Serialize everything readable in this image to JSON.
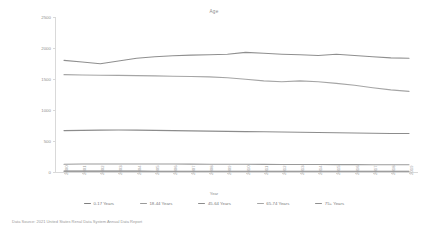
{
  "chart_data": {
    "type": "line",
    "title": "Age",
    "xlabel": "Year",
    "ylabel": "Cases per million persons",
    "ylim": [
      0,
      2500
    ],
    "yticks": [
      0,
      500,
      1000,
      1500,
      2000,
      2500
    ],
    "grid": false,
    "legend_position": "bottom",
    "categories": [
      "2000",
      "2001",
      "2002",
      "2003",
      "2004",
      "2005",
      "2006",
      "2007",
      "2008",
      "2009",
      "2010",
      "2011",
      "2012",
      "2013",
      "2014",
      "2015",
      "2016",
      "2017",
      "2018",
      "2019"
    ],
    "series": [
      {
        "name": "0-17 Years",
        "color": "#7f7f7f",
        "values": [
          14,
          14,
          14,
          14,
          14,
          13,
          13,
          13,
          13,
          13,
          13,
          13,
          13,
          13,
          13,
          13,
          13,
          13,
          13,
          13
        ]
      },
      {
        "name": "18-44 Years",
        "color": "#9a9a9a",
        "values": [
          126,
          128,
          129,
          130,
          130,
          129,
          128,
          127,
          126,
          125,
          124,
          123,
          122,
          121,
          120,
          119,
          119,
          118,
          118,
          117
        ]
      },
      {
        "name": "45-64 Years",
        "color": "#8c8c8c",
        "values": [
          668,
          672,
          676,
          678,
          676,
          672,
          668,
          664,
          660,
          656,
          652,
          648,
          644,
          640,
          636,
          632,
          628,
          624,
          622,
          620
        ]
      },
      {
        "name": "65-74 Years",
        "color": "#a5a5a5",
        "values": [
          1570,
          1565,
          1560,
          1558,
          1555,
          1550,
          1545,
          1540,
          1535,
          1520,
          1495,
          1470,
          1455,
          1470,
          1455,
          1430,
          1400,
          1360,
          1325,
          1300
        ]
      },
      {
        "name": "75+ Years",
        "color": "#8f8f8f",
        "values": [
          1800,
          1775,
          1745,
          1790,
          1835,
          1860,
          1875,
          1885,
          1890,
          1900,
          1930,
          1915,
          1900,
          1890,
          1880,
          1900,
          1880,
          1860,
          1840,
          1835
        ]
      }
    ],
    "source": "Data Source: 2021 United States Renal Data System Annual Data Report"
  }
}
